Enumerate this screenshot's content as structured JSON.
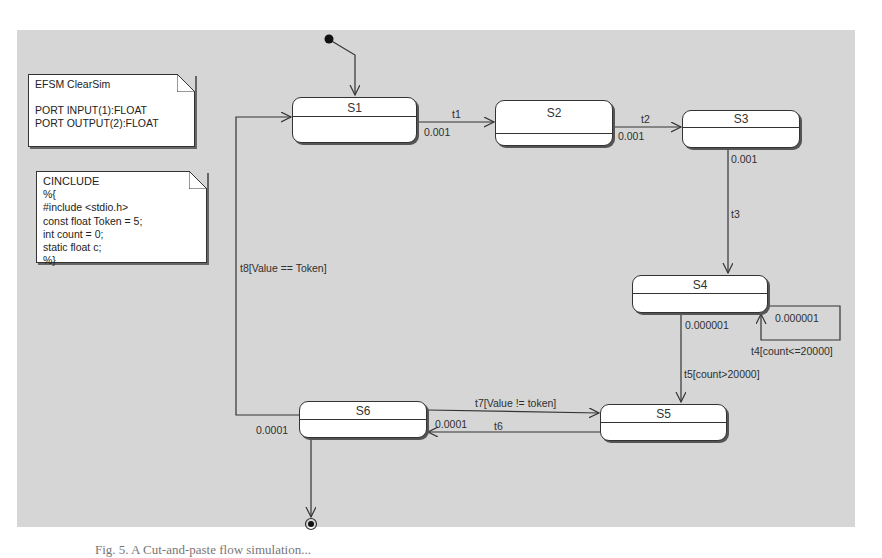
{
  "diagram": {
    "type": "EFSM state machine",
    "background_color": "#d6d6d6",
    "notes": {
      "header": {
        "lines": [
          "EFSM ClearSim",
          "",
          "PORT INPUT(1):FLOAT",
          "PORT OUTPUT(2):FLOAT"
        ]
      },
      "cinclude": {
        "lines": [
          "CINCLUDE",
          "%{",
          "#include <stdio.h>",
          "const float Token = 5;",
          "int count = 0;",
          "static float c;",
          "%}"
        ]
      }
    },
    "states": {
      "s1": {
        "name": "S1"
      },
      "s2": {
        "name": "S2"
      },
      "s3": {
        "name": "S3"
      },
      "s4": {
        "name": "S4"
      },
      "s5": {
        "name": "S5"
      },
      "s6": {
        "name": "S6"
      }
    },
    "transitions": {
      "t1": {
        "label": "t1",
        "delay": "0.001",
        "from": "S1",
        "to": "S2"
      },
      "t2": {
        "label": "t2",
        "delay": "0.001",
        "from": "S2",
        "to": "S3"
      },
      "t3": {
        "label": "t3",
        "delay": "0.001",
        "from": "S3",
        "to": "S4"
      },
      "t4": {
        "label": "t4[count<=20000]",
        "delay": "0.000001",
        "from": "S4",
        "to": "S4"
      },
      "t5": {
        "label": "t5[count>20000]",
        "delay": "0.000001",
        "from": "S4",
        "to": "S5"
      },
      "t6": {
        "label": "t6",
        "delay": "0.0001",
        "from": "S5",
        "to": "S6"
      },
      "t7": {
        "label": "t7[Value != token]",
        "from": "S6",
        "to": "S5"
      },
      "t8": {
        "label": "t8[Value == Token]",
        "delay": "0.0001",
        "from": "S6",
        "to": "S1"
      }
    },
    "initial_state": "S1",
    "final_from": "S6"
  },
  "caption": {
    "text": "Fig. 5. A Cut-and-paste flow simulation..."
  }
}
